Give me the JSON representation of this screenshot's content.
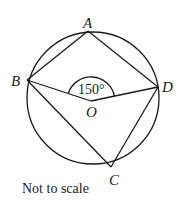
{
  "diagram": {
    "type": "circle-geometry",
    "circle": {
      "center": "O",
      "points_on_circle": [
        "A",
        "B",
        "C",
        "D"
      ]
    },
    "segments": [
      "AB",
      "AD",
      "BC",
      "CD",
      "BO",
      "OD"
    ],
    "labels": {
      "A": "A",
      "B": "B",
      "C": "C",
      "D": "D",
      "O": "O"
    },
    "angle": {
      "vertex": "O",
      "between": [
        "B",
        "D"
      ],
      "value": "150°"
    },
    "note": "Not to scale"
  }
}
